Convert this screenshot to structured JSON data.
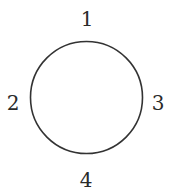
{
  "diagram": {
    "shape": "circle",
    "circle": {
      "cx": 86.5,
      "cy": 97.5,
      "r": 56,
      "stroke": "#333333",
      "stroke_width": 1.6
    },
    "labels": [
      {
        "text": "1",
        "position": "top",
        "x": 87,
        "y": 26
      },
      {
        "text": "2",
        "position": "left",
        "x": 13,
        "y": 110
      },
      {
        "text": "3",
        "position": "right",
        "x": 158,
        "y": 110
      },
      {
        "text": "4",
        "position": "bottom",
        "x": 86,
        "y": 187
      }
    ]
  }
}
